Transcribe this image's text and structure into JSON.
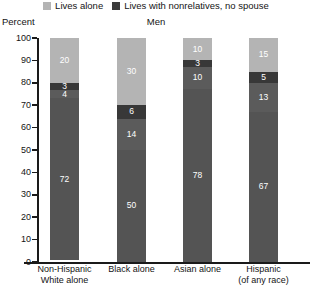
{
  "legend": {
    "items": [
      {
        "label": "Lives alone",
        "color": "#b4b4b4",
        "icon": "square-swatch-icon"
      },
      {
        "label": "Lives with nonrelatives, no spouse",
        "color": "#3c3c3c",
        "icon": "square-swatch-icon"
      }
    ]
  },
  "axis_title": "Percent",
  "title": "Men",
  "chart_data": {
    "type": "bar",
    "title": "Men",
    "xlabel": "",
    "ylabel": "Percent",
    "ylim": [
      0,
      100
    ],
    "yticks": [
      0,
      10,
      20,
      30,
      40,
      50,
      60,
      70,
      80,
      90,
      100
    ],
    "grid": false,
    "stacked": true,
    "legend_position": "top-center",
    "categories": [
      "Non-Hispanic White alone",
      "Black alone",
      "Asian alone",
      "Hispanic (of any race)"
    ],
    "category_lines": [
      [
        "Non-Hispanic",
        "White alone"
      ],
      [
        "Black alone"
      ],
      [
        "Asian alone"
      ],
      [
        "Hispanic",
        "(of any race)"
      ]
    ],
    "series": [
      {
        "name": "Lives alone",
        "color": "#b4b4b4",
        "values": [
          20,
          30,
          10,
          15
        ]
      },
      {
        "name": "Segment 2",
        "color": "#383838",
        "values": [
          3,
          6,
          3,
          5
        ]
      },
      {
        "name": "Segment 3",
        "color": "#5b5b5b",
        "values": [
          4,
          14,
          10,
          13
        ]
      },
      {
        "name": "Lives with nonrelatives, no spouse",
        "color": "#545454",
        "values": [
          72,
          50,
          78,
          67
        ]
      }
    ]
  }
}
